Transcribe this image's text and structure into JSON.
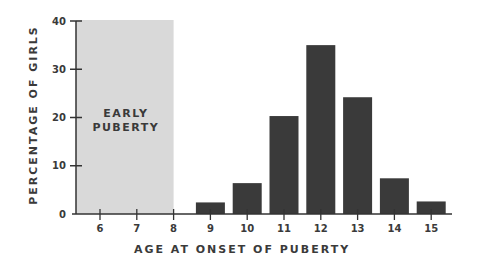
{
  "chart_data": {
    "type": "bar",
    "title": "",
    "xlabel": "AGE AT ONSET OF PUBERTY",
    "ylabel": "PERCENTAGE OF GIRLS",
    "categories": [
      "6",
      "7",
      "8",
      "9",
      "10",
      "11",
      "12",
      "13",
      "14",
      "15"
    ],
    "values": [
      0,
      0,
      0,
      2.4,
      6.4,
      20.3,
      35,
      24.2,
      7.4,
      2.6
    ],
    "ylim": [
      0,
      40
    ],
    "yticks": [
      0,
      10,
      20,
      30,
      40
    ],
    "grid": false,
    "legend": null,
    "annotations": [
      {
        "text_lines": [
          "EARLY",
          "PUBERTY"
        ],
        "shaded_x_range": [
          "start",
          "8"
        ],
        "fill": "#d9d9d9"
      }
    ],
    "bar_color": "#3a3a3a",
    "axis_color": "#333333"
  },
  "labels": {
    "x_axis_title": "AGE AT ONSET OF PUBERTY",
    "y_axis_title": "PERCENTAGE OF GIRLS",
    "region_line1": "EARLY",
    "region_line2": "PUBERTY"
  }
}
